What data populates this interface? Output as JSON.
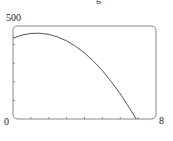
{
  "chart_data": {
    "type": "line",
    "title": "",
    "xlabel": "",
    "ylabel": "",
    "xlim": [
      0,
      8
    ],
    "ylim": [
      0,
      500
    ],
    "x_tick_labels": [
      "0",
      "8"
    ],
    "y_tick_labels": [
      "0",
      "500"
    ],
    "x_ticks": [
      1,
      2,
      3,
      4,
      5,
      6,
      7
    ],
    "y_ticks": [
      100,
      200,
      300,
      400
    ],
    "grid": false,
    "frame": "rounded-box",
    "series": [
      {
        "name": "curve",
        "color": "#555555",
        "x": [
          0,
          0.5,
          1,
          1.5,
          2,
          2.5,
          3,
          3.5,
          4,
          4.5,
          5,
          5.5,
          6,
          6.5,
          6.9
        ],
        "values": [
          435,
          451,
          460,
          461,
          455,
          441,
          420,
          391,
          355,
          311,
          260,
          201,
          135,
          61,
          0
        ]
      }
    ],
    "clipped_top_text": "g"
  },
  "labels": {
    "y_max": "500",
    "origin": "0",
    "x_max": "8"
  }
}
